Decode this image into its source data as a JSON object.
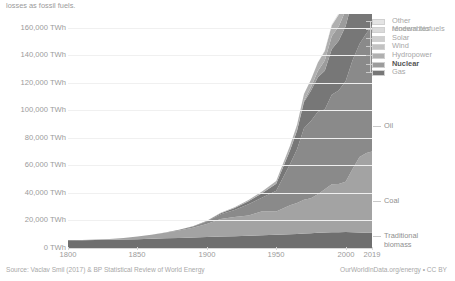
{
  "subtitle": "losses as fossil fuels.",
  "footer": {
    "source": "Source: Vaclav Smil (2017) & BP Statistical Review of World Energy",
    "credit": "OurWorldInData.org/energy • CC BY"
  },
  "chart_data": {
    "type": "area",
    "stacked": true,
    "title": "",
    "subtitle": "losses as fossil fuels.",
    "xlabel": "",
    "ylabel": "",
    "xlim": [
      1800,
      2019
    ],
    "ylim": [
      0,
      170000
    ],
    "grid": true,
    "legend_position": "right",
    "y_ticks": [
      0,
      20000,
      40000,
      60000,
      80000,
      100000,
      120000,
      140000,
      160000
    ],
    "y_tick_labels": [
      "0 TWh",
      "20,000 TWh",
      "40,000 TWh",
      "60,000 TWh",
      "80,000 TWh",
      "100,000 TWh",
      "120,000 TWh",
      "140,000 TWh",
      "160,000 TWh"
    ],
    "x_ticks": [
      1800,
      1850,
      1900,
      1950,
      2000,
      2019
    ],
    "x_tick_labels": [
      "1800",
      "1850",
      "1900",
      "1950",
      "2000",
      "2019"
    ],
    "x": [
      1800,
      1810,
      1820,
      1830,
      1840,
      1850,
      1860,
      1870,
      1880,
      1890,
      1900,
      1910,
      1920,
      1930,
      1940,
      1950,
      1960,
      1965,
      1970,
      1975,
      1980,
      1985,
      1990,
      1995,
      2000,
      2005,
      2010,
      2015,
      2019
    ],
    "series": [
      {
        "name": "Traditional biomass",
        "color": "#6f6f6f",
        "values": [
          5556,
          5700,
          5850,
          6000,
          6200,
          6400,
          6700,
          7000,
          7300,
          7600,
          8000,
          8300,
          8600,
          8900,
          9200,
          9600,
          10000,
          10200,
          10500,
          10700,
          11000,
          11200,
          11400,
          11500,
          11600,
          11400,
          11200,
          11100,
          11100
        ]
      },
      {
        "name": "Coal",
        "color": "#a3a3a3",
        "values": [
          97,
          180,
          320,
          580,
          1100,
          1960,
          2900,
          4000,
          5400,
          7100,
          9500,
          12700,
          14000,
          14800,
          17500,
          17000,
          21000,
          22500,
          24500,
          25500,
          28000,
          31500,
          35000,
          35000,
          36500,
          46000,
          55000,
          58000,
          59000
        ]
      },
      {
        "name": "Oil",
        "color": "#8a8a8a",
        "values": [
          0,
          0,
          0,
          0,
          0,
          0,
          50,
          200,
          500,
          900,
          1800,
          3500,
          5000,
          8000,
          10000,
          15000,
          30000,
          39000,
          52000,
          56000,
          60000,
          58000,
          65000,
          68000,
          73000,
          79000,
          82000,
          87000,
          91000
        ]
      },
      {
        "name": "Gas",
        "color": "#777777",
        "values": [
          0,
          0,
          0,
          0,
          0,
          0,
          0,
          0,
          50,
          150,
          400,
          800,
          1400,
          2200,
          3200,
          5000,
          10000,
          13500,
          19000,
          22000,
          25000,
          28000,
          33000,
          36000,
          40000,
          44000,
          50000,
          55000,
          59000
        ]
      },
      {
        "name": "Nuclear",
        "color": "#9c9c9c",
        "values": [
          0,
          0,
          0,
          0,
          0,
          0,
          0,
          0,
          0,
          0,
          0,
          0,
          0,
          0,
          0,
          0,
          200,
          400,
          1000,
          2500,
          4500,
          7500,
          9500,
          10500,
          11500,
          11800,
          11600,
          10800,
          11500
        ]
      },
      {
        "name": "Hydropower",
        "color": "#b0b0b0",
        "values": [
          0,
          0,
          0,
          0,
          0,
          0,
          0,
          0,
          0,
          30,
          100,
          300,
          600,
          1000,
          1400,
          2000,
          3200,
          3900,
          4800,
          5500,
          6200,
          7000,
          7800,
          8400,
          9200,
          9900,
          11000,
          11800,
          12500
        ]
      },
      {
        "name": "Wind",
        "color": "#c2c2c2",
        "values": [
          0,
          0,
          0,
          0,
          0,
          0,
          0,
          0,
          0,
          0,
          0,
          0,
          0,
          0,
          0,
          0,
          0,
          0,
          0,
          0,
          0,
          20,
          60,
          180,
          500,
          1100,
          2500,
          4500,
          6000
        ]
      },
      {
        "name": "Solar",
        "color": "#cfcfcf",
        "values": [
          0,
          0,
          0,
          0,
          0,
          0,
          0,
          0,
          0,
          0,
          0,
          0,
          0,
          0,
          0,
          0,
          0,
          0,
          0,
          0,
          0,
          0,
          5,
          10,
          30,
          100,
          400,
          1500,
          3000
        ]
      },
      {
        "name": "Modern biofuels",
        "color": "#dadada",
        "values": [
          0,
          0,
          0,
          0,
          0,
          0,
          0,
          0,
          0,
          0,
          0,
          0,
          0,
          0,
          0,
          0,
          0,
          0,
          0,
          0,
          50,
          120,
          250,
          400,
          600,
          900,
          1400,
          1800,
          2000
        ]
      },
      {
        "name": "Other renewables",
        "color": "#e4e4e4",
        "values": [
          0,
          0,
          0,
          0,
          0,
          0,
          0,
          0,
          0,
          0,
          0,
          0,
          0,
          0,
          0,
          0,
          0,
          0,
          50,
          100,
          200,
          350,
          550,
          750,
          1000,
          1300,
          1700,
          2100,
          2400
        ]
      }
    ],
    "legend_entries": [
      {
        "label": "Other renewables",
        "color": "#e4e4e4",
        "bold": false
      },
      {
        "label": "Modern biofuels",
        "color": "#dadada",
        "bold": false
      },
      {
        "label": "Solar",
        "color": "#cfcfcf",
        "bold": false
      },
      {
        "label": "Wind",
        "color": "#c2c2c2",
        "bold": false
      },
      {
        "label": "Hydropower",
        "color": "#b0b0b0",
        "bold": false
      },
      {
        "label": "Nuclear",
        "color": "#9c9c9c",
        "bold": true
      },
      {
        "label": "Gas",
        "color": "#777777",
        "bold": false
      }
    ],
    "direct_labels": [
      {
        "label": "Oil",
        "color": "#8a8a8a"
      },
      {
        "label": "Coal",
        "color": "#a3a3a3"
      },
      {
        "label": "Traditional biomass",
        "color": "#6f6f6f"
      }
    ]
  }
}
